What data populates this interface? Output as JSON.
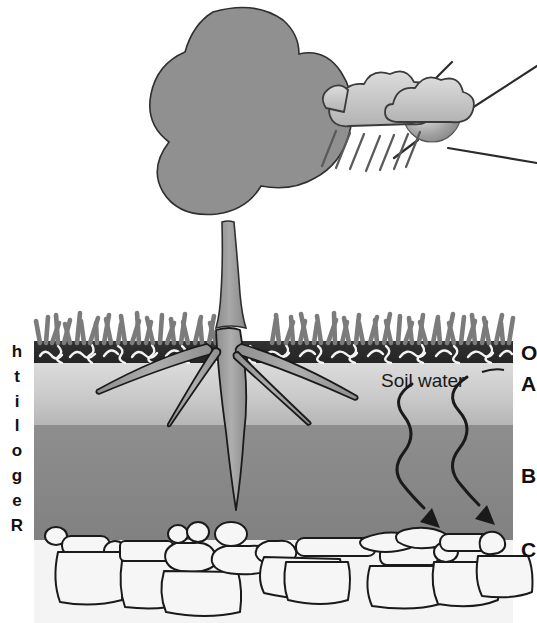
{
  "figure": {
    "background_color": "#ffffff"
  },
  "left_axis": {
    "name": "regolith-vertical-label",
    "text": "Regolith",
    "letters": [
      "R",
      "e",
      "g",
      "o",
      "l",
      "i",
      "t",
      "h"
    ],
    "orientation": "vertical-bottom-to-top"
  },
  "horizons": [
    {
      "id": "O",
      "label": "O",
      "name": "Organic horizon",
      "color": "#2b2b2b",
      "top": 341,
      "bottom": 363
    },
    {
      "id": "A",
      "label": "A",
      "name": "A horizon (topsoil)",
      "color": "#c9c9c9",
      "top": 363,
      "bottom": 425
    },
    {
      "id": "B",
      "label": "B",
      "name": "B horizon (subsoil)",
      "color": "#8a8a8a",
      "top": 425,
      "bottom": 536
    },
    {
      "id": "C",
      "label": "C",
      "name": "C horizon (bedrock)",
      "color": "#f2f2f2",
      "top": 536,
      "bottom": 623
    }
  ],
  "annotations": {
    "soil_water": {
      "label": "Soil water",
      "description": "Two wavy downward arrows showing water percolating through the soil"
    }
  },
  "sky": {
    "sun": {
      "name": "sun",
      "color": "#9a9a9a",
      "highlight": "#f3f3f3",
      "ray_count": 6
    },
    "clouds": {
      "name": "clouds",
      "color": "#c6c6c6",
      "outline": "#3a3a3a",
      "count": 3
    },
    "rain": {
      "name": "rain-streaks",
      "color": "#6a6a6a",
      "count": 7
    }
  },
  "vegetation": {
    "tree": {
      "name": "tree",
      "canopy_color": "#909090",
      "trunk_color": "#9a9a9a",
      "outline": "#2f2f2f"
    },
    "roots": {
      "name": "tree-roots",
      "color": "#9a9a9a",
      "outline": "#1e1e1e",
      "count": 5
    },
    "grass": {
      "name": "grass-tufts",
      "color": "#7d7d7d"
    }
  },
  "colors": {
    "o_horizon": "#2b2b2b",
    "a_horizon_top": "#d4d4d4",
    "a_horizon_bottom": "#bdbdbd",
    "b_horizon": "#8a8a8a",
    "c_horizon": "#f2f2f2",
    "outline": "#1a1a1a",
    "text": "#111111"
  }
}
